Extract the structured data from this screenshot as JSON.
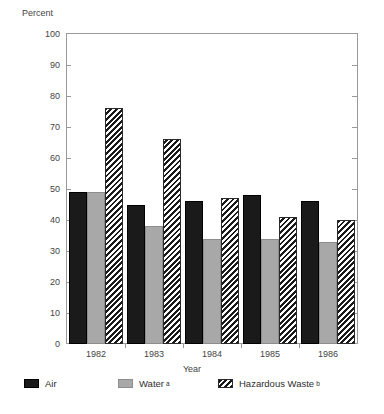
{
  "chart_data": {
    "type": "bar",
    "title": "",
    "subtitle": "",
    "xlabel": "Year",
    "ylabel": "Percent",
    "ylim": [
      0,
      100
    ],
    "yticks": [
      0,
      10,
      20,
      30,
      40,
      50,
      60,
      70,
      80,
      90,
      100
    ],
    "ytick_labels": [
      "0",
      "10",
      "20",
      "30",
      "40",
      "50",
      "60",
      "70",
      "80",
      "90",
      "100"
    ],
    "grid": false,
    "legend_position": "bottom-left",
    "categories": [
      "1982",
      "1983",
      "1984",
      "1985",
      "1986"
    ],
    "series": [
      {
        "name": "Air",
        "label": "Air",
        "footnote": "",
        "color": "#1a1a1a",
        "pattern": "solid-black",
        "values": [
          49,
          45,
          46,
          48,
          46
        ]
      },
      {
        "name": "Water",
        "label": "Water",
        "footnote": "a",
        "color": "#a8a8a8",
        "pattern": "solid-gray",
        "values": [
          49,
          38,
          34,
          34,
          33
        ]
      },
      {
        "name": "Hazardous Waste",
        "label": "Hazardous Waste",
        "footnote": "b",
        "color": "#1a1a1a",
        "pattern": "diagonal-hatch",
        "values": [
          76,
          66,
          47,
          41,
          40
        ]
      }
    ]
  }
}
